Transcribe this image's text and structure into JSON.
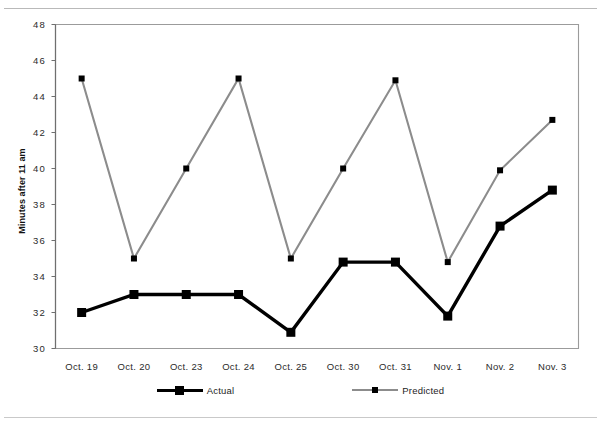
{
  "chart_data": {
    "type": "line",
    "title": "",
    "xlabel": "",
    "ylabel": "Minutes after 11 am",
    "categories": [
      "Oct. 19",
      "Oct. 20",
      "Oct. 23",
      "Oct. 24",
      "Oct. 25",
      "Oct. 30",
      "Oct. 31",
      "Nov. 1",
      "Nov. 2",
      "Nov. 3"
    ],
    "series": [
      {
        "name": "Actual",
        "color": "#000000",
        "values": [
          32.0,
          33.0,
          33.0,
          33.0,
          30.9,
          34.8,
          34.8,
          31.8,
          36.8,
          38.8
        ]
      },
      {
        "name": "Predicted",
        "color": "#8c8c8c",
        "values": [
          45.0,
          35.0,
          40.0,
          45.0,
          35.0,
          40.0,
          44.9,
          34.8,
          39.9,
          42.7
        ]
      }
    ],
    "ylim": [
      30,
      48
    ],
    "ytick_step": 2,
    "yticks": [
      "48",
      "46",
      "44",
      "42",
      "40",
      "38",
      "36",
      "34",
      "32",
      "30"
    ],
    "grid": false,
    "legend_position": "bottom"
  },
  "legend": {
    "entries": [
      {
        "label": "Actual",
        "swatch": "actual-line-swatch"
      },
      {
        "label": "Predicted",
        "swatch": "predicted-line-swatch"
      }
    ]
  }
}
